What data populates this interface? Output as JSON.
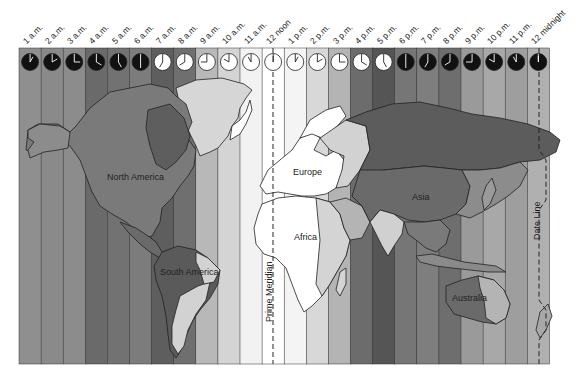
{
  "hours": [
    {
      "label": "1 a.m.",
      "hour": 1,
      "shade": "#8f8f8f"
    },
    {
      "label": "2 a.m.",
      "hour": 2,
      "shade": "#8a8a8a"
    },
    {
      "label": "3 a.m.",
      "hour": 3,
      "shade": "#8c8c8c"
    },
    {
      "label": "4 a.m.",
      "hour": 4,
      "shade": "#6a6a6a"
    },
    {
      "label": "5 a.m.",
      "hour": 5,
      "shade": "#727272"
    },
    {
      "label": "6 a.m.",
      "hour": 6,
      "shade": "#7c7c7c"
    },
    {
      "label": "7 a.m.",
      "hour": 7,
      "shade": "#5e5e5e"
    },
    {
      "label": "8 a.m.",
      "hour": 8,
      "shade": "#6f6f6f"
    },
    {
      "label": "9 a.m.",
      "hour": 9,
      "shade": "#b8b8b8"
    },
    {
      "label": "10 a.m.",
      "hour": 10,
      "shade": "#d4d4d4"
    },
    {
      "label": "11 a.m.",
      "hour": 11,
      "shade": "#f2f2f2"
    },
    {
      "label": "12 noon",
      "hour": 12,
      "shade": "#ffffff"
    },
    {
      "label": "1 p.m.",
      "hour": 13,
      "shade": "#f4f4f4"
    },
    {
      "label": "2 p.m.",
      "hour": 14,
      "shade": "#d8d8d8"
    },
    {
      "label": "3 p.m.",
      "hour": 15,
      "shade": "#b4b4b4"
    },
    {
      "label": "4 p.m.",
      "hour": 16,
      "shade": "#6c6c6c"
    },
    {
      "label": "5 p.m.",
      "hour": 17,
      "shade": "#555555"
    },
    {
      "label": "6 p.m.",
      "hour": 18,
      "shade": "#767676"
    },
    {
      "label": "7 p.m.",
      "hour": 19,
      "shade": "#7e7e7e"
    },
    {
      "label": "8 p.m.",
      "hour": 20,
      "shade": "#6e6e6e"
    },
    {
      "label": "9 p.m.",
      "hour": 21,
      "shade": "#9a9a9a"
    },
    {
      "label": "10 p.m.",
      "hour": 22,
      "shade": "#a8a8a8"
    },
    {
      "label": "11 p.m.",
      "hour": 23,
      "shade": "#9e9e9e"
    },
    {
      "label": "12 midnight",
      "hour": 24,
      "shade": "#b0b0b0"
    }
  ],
  "regions": {
    "north_america": "North America",
    "south_america": "South America",
    "europe": "Europe",
    "africa": "Africa",
    "asia": "Asia",
    "australia": "Australia"
  },
  "lines": {
    "prime_meridian": "Prime Meridian",
    "date_line": "Date Line"
  },
  "colors": {
    "outline": "#222222",
    "land_light": "#d9d9d9",
    "land_white": "#ffffff",
    "land_mid": "#8a8a8a",
    "land_dark": "#5a5a5a",
    "clock_dark": "#111111",
    "clock_light": "#ffffff"
  }
}
